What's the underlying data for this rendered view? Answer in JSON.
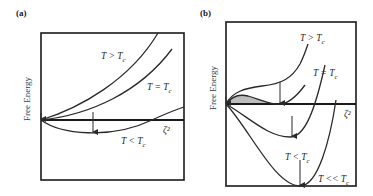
{
  "figure": {
    "panel_a": {
      "label": "(a)",
      "ylabel": "Free Energy",
      "xlabel": "ζ²",
      "curves": [
        {
          "name": "T > T",
          "sub": "c"
        },
        {
          "name": "T = T",
          "sub": "c"
        },
        {
          "name": "T < T",
          "sub": "c"
        }
      ]
    },
    "panel_b": {
      "label": "(b)",
      "ylabel": "Free Energy",
      "xlabel": "ζ²",
      "curves": [
        {
          "name": "T > T",
          "sub": "c"
        },
        {
          "name": "T = T",
          "sub": "c"
        },
        {
          "name": "T < T",
          "sub": "c"
        },
        {
          "name": "T << T",
          "sub": "c"
        }
      ]
    },
    "colors": {
      "line": "#2a2a2a",
      "shade": "#bdbdbd"
    }
  }
}
